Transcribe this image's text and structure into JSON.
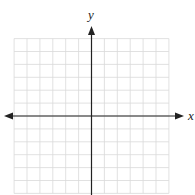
{
  "diagram": {
    "type": "coordinate-plane",
    "x_axis_label": "x",
    "y_axis_label": "y",
    "grid": {
      "columns_left_of_axis": 6,
      "columns_right_of_axis": 6,
      "rows_above_axis": 6,
      "rows_below_axis": 6,
      "cell_size_px": 12.9
    },
    "colors": {
      "grid_line": "#d9d9d9",
      "axis": "#222222",
      "background": "#ffffff"
    },
    "arrows": [
      "x-left",
      "x-right",
      "y-up"
    ]
  }
}
